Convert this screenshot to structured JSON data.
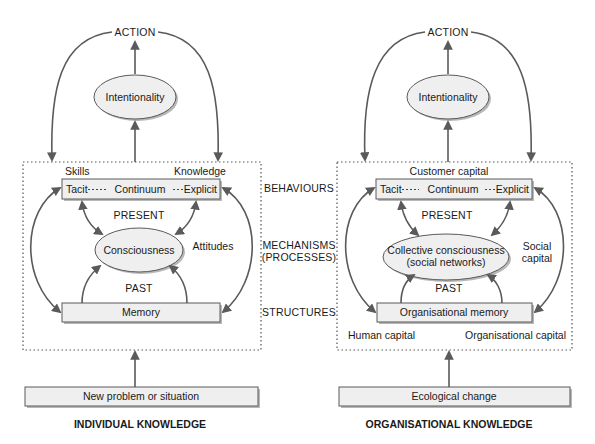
{
  "diagram": {
    "colors": {
      "line": "#5a5a5a",
      "box_fill": "#efefef",
      "shadow": "#b8b8b8",
      "text": "#1a1a1a"
    },
    "middle_labels": {
      "behaviours": "BEHAVIOURS",
      "mechanisms_line1": "MECHANISMS",
      "mechanisms_line2": "(PROCESSES)",
      "structures": "STRUCTURES"
    },
    "individual": {
      "action": "ACTION",
      "intentionality": "Intentionality",
      "top_left_label": "Skills",
      "top_right_label": "Knowledge",
      "continuum": {
        "left": "Tacit",
        "middle": "Continuum",
        "right": "Explicit"
      },
      "present": "PRESENT",
      "consciousness": "Consciousness",
      "side_label": "Attitudes",
      "past": "PAST",
      "memory": "Memory",
      "input": "New problem or situation",
      "title": "INDIVIDUAL KNOWLEDGE"
    },
    "organisational": {
      "action": "ACTION",
      "intentionality": "Intentionality",
      "top_label": "Customer capital",
      "continuum": {
        "left": "Tacit",
        "middle": "Continuum",
        "right": "Explicit"
      },
      "present": "PRESENT",
      "consciousness_line1": "Collective consciousness",
      "consciousness_line2": "(social networks)",
      "side_label_line1": "Social",
      "side_label_line2": "capital",
      "past": "PAST",
      "memory": "Organisational memory",
      "bottom_left_label": "Human capital",
      "bottom_right_label": "Organisational capital",
      "input": "Ecological change",
      "title": "ORGANISATIONAL KNOWLEDGE"
    }
  }
}
